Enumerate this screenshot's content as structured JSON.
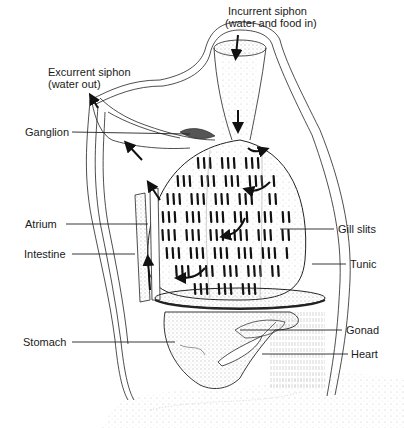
{
  "figure": {
    "background": "#ffffff",
    "ink_color": "#1a1a1a"
  },
  "labels": {
    "incurrent_siphon": {
      "line1": "Incurrent siphon",
      "line2": "(water and food in)"
    },
    "excurrent_siphon": {
      "line1": "Excurrent siphon",
      "line2": "(water out)"
    },
    "ganglion": "Ganglion",
    "atrium": "Atrium",
    "intestine": "Intestine",
    "stomach": "Stomach",
    "gill_slits": "Gill slits",
    "tunic": "Tunic",
    "gonad": "Gonad",
    "heart": "Heart"
  }
}
